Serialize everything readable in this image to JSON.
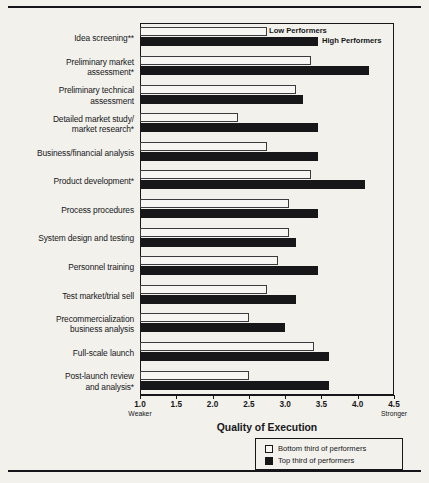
{
  "chart_data": {
    "type": "bar",
    "orientation": "horizontal",
    "title": "",
    "xlabel": "Quality of Execution",
    "ylabel": "",
    "xlim": [
      1.0,
      4.5
    ],
    "xticks": [
      "1.0",
      "1.5",
      "2.0",
      "2.5",
      "3.0",
      "3.5",
      "4.0",
      "4.5"
    ],
    "xtick_values": [
      1.0,
      1.5,
      2.0,
      2.5,
      3.0,
      3.5,
      4.0,
      4.5
    ],
    "axis_end_labels": {
      "left": "Weaker",
      "right": "Stronger"
    },
    "grid": false,
    "legend_position": "bottom-right",
    "categories": [
      "Idea screening**",
      "Preliminary market assessment*",
      "Preliminary technical assessment",
      "Detailed market study/ market research*",
      "Business/financial analysis",
      "Product development*",
      "Process procedures",
      "System design and testing",
      "Personnel training",
      "Test market/trial sell",
      "Precommercialization business analysis",
      "Full-scale launch",
      "Post-launch review and analysis*"
    ],
    "category_lines": [
      [
        "Idea screening**"
      ],
      [
        "Preliminary market",
        "assessment*"
      ],
      [
        "Preliminary technical",
        "assessment"
      ],
      [
        "Detailed market study/",
        "market research*"
      ],
      [
        "Business/financial analysis"
      ],
      [
        "Product development*"
      ],
      [
        "Process procedures"
      ],
      [
        "System design and testing"
      ],
      [
        "Personnel training"
      ],
      [
        "Test market/trial sell"
      ],
      [
        "Precommercialization",
        "business analysis"
      ],
      [
        "Full-scale launch"
      ],
      [
        "Post-launch review",
        "and analysis*"
      ]
    ],
    "series": [
      {
        "name": "Bottom third of performers",
        "callout": "Low Performers",
        "color": "#ffffff",
        "values": [
          2.75,
          3.35,
          3.15,
          2.35,
          2.75,
          3.35,
          3.05,
          3.05,
          2.9,
          2.75,
          2.5,
          3.4,
          2.5
        ]
      },
      {
        "name": "Top third of performers",
        "callout": "High Performers",
        "color": "#17171a",
        "values": [
          3.45,
          4.15,
          3.25,
          3.45,
          3.45,
          4.1,
          3.45,
          3.15,
          3.45,
          3.15,
          3.0,
          3.6,
          3.6
        ]
      }
    ]
  },
  "legend": {
    "items": [
      {
        "label": "Bottom third of performers"
      },
      {
        "label": "Top third of performers"
      }
    ]
  },
  "colors": {
    "background": "#f2f1ec",
    "ink": "#17171a",
    "low_fill": "#f7f6f2",
    "high_fill": "#17171a"
  }
}
